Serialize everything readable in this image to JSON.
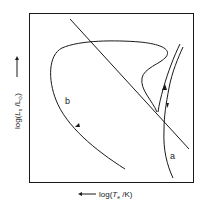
{
  "diagram": {
    "type": "Hertzsprung-Russell evolutionary tracks",
    "x_axis": {
      "prefix": "log(",
      "symbol": "T",
      "subscript": "e",
      "suffix": " /K)",
      "direction": "increasing to the left"
    },
    "y_axis": {
      "prefix": "log(",
      "symbol": "L",
      "subscript": "s",
      "suffix": " /L",
      "sun_symbol": "⊙",
      "close": ")",
      "direction": "increasing upward"
    },
    "curves": [
      {
        "id": "a",
        "label": "a",
        "description": "nearly vertical double track on right side with arrows"
      },
      {
        "id": "b",
        "label": "b",
        "description": "large loop track sweeping left then down with arrow"
      }
    ],
    "lines": [
      {
        "id": "diagonal",
        "description": "straight diagonal line from upper left to lower right"
      }
    ],
    "colors": {
      "ink": "#1a1a1a",
      "background": "#ffffff"
    }
  }
}
